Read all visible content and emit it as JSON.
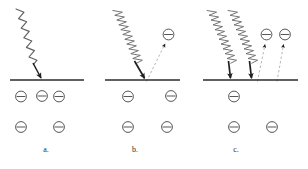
{
  "figure": {
    "background_color": "#ffffff",
    "stroke_color": "#3a3a3a",
    "surface_color": "#2b2b2b",
    "wave_color": "#6e6e6e",
    "arrow_color": "#1f1f1f",
    "dashed_color": "#9a9a9a"
  },
  "panels": [
    {
      "id": "a",
      "label": "a.",
      "wave": {
        "name": "incident-light-wave",
        "count": 1,
        "wavelength": "long",
        "frequency": "low",
        "cycles": 5
      },
      "impact_arrows": 1,
      "ejected_electrons": 0,
      "bound_electrons_row1": 3,
      "bound_electrons_row2": 2,
      "surface": {
        "x1": 10,
        "x2": 84,
        "y": 80
      }
    },
    {
      "id": "b",
      "label": "b.",
      "wave": {
        "name": "incident-light-wave",
        "count": 1,
        "wavelength": "short",
        "frequency": "high",
        "cycles": 13
      },
      "impact_arrows": 1,
      "ejected_electrons": 1,
      "bound_electrons_row1": 2,
      "bound_electrons_row2": 2,
      "surface": {
        "x1": 105,
        "x2": 180,
        "y": 80
      }
    },
    {
      "id": "c",
      "label": "c.",
      "wave": {
        "name": "incident-light-wave",
        "count": 2,
        "wavelength": "short",
        "frequency": "high",
        "cycles": 13
      },
      "impact_arrows": 2,
      "ejected_electrons": 2,
      "bound_electrons_row1": 1,
      "bound_electrons_row2": 2,
      "surface": {
        "x1": 203,
        "x2": 298,
        "y": 80
      }
    }
  ],
  "symbols": {
    "electron_glyph": "minus-in-circle",
    "electron_charge_sign": "−"
  }
}
